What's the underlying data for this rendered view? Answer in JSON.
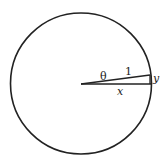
{
  "diagram": {
    "labels": {
      "angle": "θ",
      "hypotenuse": "1",
      "opposite": "y",
      "adjacent": "x"
    },
    "colors": {
      "stroke": "#222222",
      "background": "#ffffff"
    }
  }
}
